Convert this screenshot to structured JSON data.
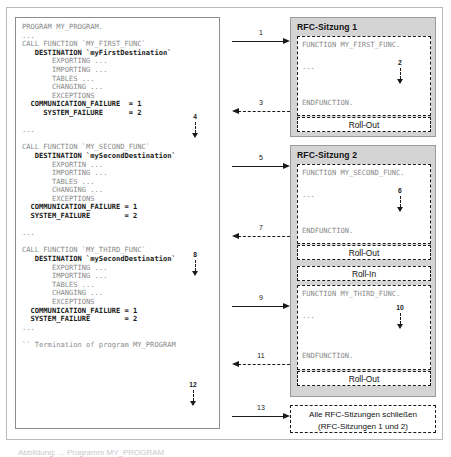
{
  "program_box": {
    "name": "ABAP program source listing",
    "lines": [
      {
        "text": "PROGRAM MY_PROGRAM.",
        "style": "plain"
      },
      {
        "text": "...",
        "style": "plain"
      },
      {
        "text": "CALL FUNCTION `MY_FIRST_FUNC`",
        "style": "plain"
      },
      {
        "text": "   DESTINATION `myFirstDestination`",
        "style": "bold"
      },
      {
        "text": "       EXPORTING ...",
        "style": "plain"
      },
      {
        "text": "       IMPORTING ...",
        "style": "plain"
      },
      {
        "text": "       TABLES ...",
        "style": "plain"
      },
      {
        "text": "       CHANGING ...",
        "style": "plain"
      },
      {
        "text": "       EXCEPTIONS",
        "style": "plain"
      },
      {
        "text": "  COMMUNICATION_FAILURE  = 1",
        "style": "bold"
      },
      {
        "text": "     SYSTEM_FAILURE      = 2",
        "style": "bold"
      },
      {
        "text": "",
        "style": "plain"
      },
      {
        "text": "...",
        "style": "plain"
      },
      {
        "text": "",
        "style": "plain"
      },
      {
        "text": "CALL FUNCTION `MY_SECOND_FUNC`",
        "style": "plain"
      },
      {
        "text": "   DESTINATION `mySecondDestination`",
        "style": "bold"
      },
      {
        "text": "       EXPORTIN ...",
        "style": "plain"
      },
      {
        "text": "       IMPORTING ...",
        "style": "plain"
      },
      {
        "text": "       TABLES ...",
        "style": "plain"
      },
      {
        "text": "       CHANGING ...",
        "style": "plain"
      },
      {
        "text": "       EXCEPTIONS",
        "style": "plain"
      },
      {
        "text": "  COMMUNICATION_FAILURE = 1",
        "style": "bold"
      },
      {
        "text": "  SYSTEM_FAILURE        = 2",
        "style": "bold"
      },
      {
        "text": "",
        "style": "plain"
      },
      {
        "text": "...",
        "style": "plain"
      },
      {
        "text": "",
        "style": "plain"
      },
      {
        "text": "CALL FUNCTION `MY_THIRD_FUNC`",
        "style": "plain"
      },
      {
        "text": "   DESTINATION `mySecondDestination`",
        "style": "bold"
      },
      {
        "text": "       EXPORTING ...",
        "style": "plain"
      },
      {
        "text": "       IMPORTING ...",
        "style": "plain"
      },
      {
        "text": "       TABLES ...",
        "style": "plain"
      },
      {
        "text": "       CHANGING ...",
        "style": "plain"
      },
      {
        "text": "       EXCEPTIONS",
        "style": "plain"
      },
      {
        "text": "  COMMUNICATION_FAILURE = 1",
        "style": "bold"
      },
      {
        "text": "  SYSTEM_FAILURE        = 2",
        "style": "bold"
      },
      {
        "text": "...",
        "style": "plain"
      },
      {
        "text": "",
        "style": "plain"
      },
      {
        "text": "`` Termination of program MY_PROGRAM",
        "style": "plain"
      }
    ],
    "step_markers": [
      {
        "number": "4"
      },
      {
        "number": "8"
      },
      {
        "number": "12"
      }
    ]
  },
  "flow_arrows": [
    {
      "number": "1",
      "direction": "right",
      "line": "solid"
    },
    {
      "number": "3",
      "direction": "left",
      "line": "dashed"
    },
    {
      "number": "5",
      "direction": "right",
      "line": "solid"
    },
    {
      "number": "7",
      "direction": "left",
      "line": "dashed"
    },
    {
      "number": "9",
      "direction": "right",
      "line": "solid"
    },
    {
      "number": "11",
      "direction": "left",
      "line": "dashed"
    },
    {
      "number": "13",
      "direction": "right",
      "line": "solid"
    }
  ],
  "sessions": [
    {
      "title": "RFC-Sitzung 1",
      "function": {
        "header": "FUNCTION MY_FIRST_FUNC.",
        "body": "...",
        "footer": "ENDFUNCTION.",
        "step_number": "2"
      },
      "roll_out_label": "Roll-Out"
    },
    {
      "title": "RFC-Sitzung 2",
      "function": {
        "header": "FUNCTION MY_SECOND_FUNC.",
        "body": "...",
        "footer": "ENDFUNCTION.",
        "step_number": "6"
      },
      "roll_out_label": "Roll-Out",
      "roll_in_label": "Roll-In",
      "function2": {
        "header": "FUNCTION MY_THIRD_FUNC.",
        "body": "...",
        "footer": "ENDFUNCTION.",
        "step_number": "10"
      },
      "roll_out_label2": "Roll-Out"
    }
  ],
  "close_sessions_box": {
    "line1": "Alle RFC-Stizungen schließen",
    "line2": "(RFC-Sitzungen 1 und 2)"
  },
  "caption": {
    "text": "Abbildung: ... Programm MY_PROGRAM"
  },
  "colors": {
    "session_fill": "#d4d4d4",
    "box_border": "#1a1a1a",
    "code_text": "#8a8a8a",
    "frame": "#b9b9b9"
  }
}
